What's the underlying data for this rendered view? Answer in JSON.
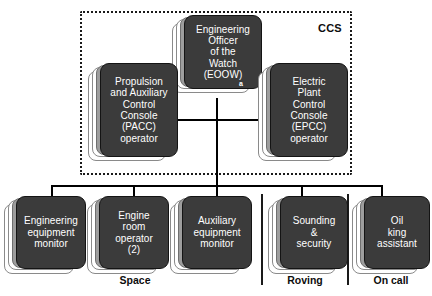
{
  "diagram": {
    "region": {
      "name": "CCS",
      "label": "CCS"
    },
    "colors": {
      "card_fill": "#3b3b3b",
      "card_border": "#141414",
      "sheet_mid": "#9d9d9d",
      "sheet_back": "#ffffff",
      "line": "#000000",
      "text_on_card": "#ffffff",
      "text_label": "#0d0d0d"
    },
    "nodes": {
      "eoow": {
        "lines": [
          "Engineering",
          "Officer",
          "of the",
          "Watch",
          "(EOOW)"
        ],
        "text": "Engineering\nOfficer\nof the\nWatch\n(EOOW)",
        "footnote": "a"
      },
      "pacc": {
        "lines": [
          "Propulsion",
          "and Auxiliary",
          "Control",
          "Console",
          "(PACC)",
          "operator"
        ],
        "text": "Propulsion\nand Auxiliary\nControl\nConsole\n(PACC)\noperator"
      },
      "epcc": {
        "lines": [
          "Electric",
          "Plant",
          "Control",
          "Console",
          "(EPCC)",
          "operator"
        ],
        "text": "Electric\nPlant\nControl\nConsole\n(EPCC)\noperator"
      },
      "engineering_equipment_monitor": {
        "lines": [
          "Engineering",
          "equipment",
          "monitor"
        ],
        "text": "Engineering\nequipment\nmonitor"
      },
      "engine_room_operator": {
        "lines": [
          "Engine",
          "room",
          "operator",
          "(2)"
        ],
        "text": "Engine\nroom\noperator\n(2)"
      },
      "auxiliary_equipment_monitor": {
        "lines": [
          "Auxiliary",
          "equipment",
          "monitor"
        ],
        "text": "Auxiliary\nequipment\nmonitor"
      },
      "sounding_security": {
        "lines": [
          "Sounding",
          "&",
          "security"
        ],
        "text": "Sounding\n&\nsecurity"
      },
      "oil_king_assistant": {
        "lines": [
          "Oil",
          "king",
          "assistant"
        ],
        "text": "Oil\nking\nassistant"
      }
    },
    "group_labels": {
      "space": "Space",
      "roving": "Roving",
      "on_call": "On call"
    }
  }
}
